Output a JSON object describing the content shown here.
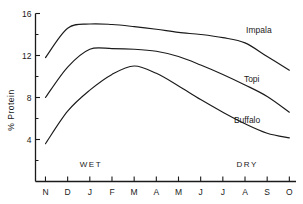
{
  "chart_data": {
    "type": "line",
    "title": "",
    "xlabel": "",
    "ylabel": "% Protein",
    "categories": [
      "N",
      "D",
      "J",
      "F",
      "M",
      "A",
      "M",
      "J",
      "J",
      "A",
      "S",
      "O"
    ],
    "xlim": [
      -0.45,
      11.3
    ],
    "ylim": [
      0,
      16
    ],
    "yticks_major": [
      4,
      8,
      12,
      16
    ],
    "yticks_minor": [
      2,
      6,
      10,
      14
    ],
    "grid": false,
    "legend_position": "inline-right",
    "series": [
      {
        "name": "Impala",
        "values": [
          11.8,
          14.6,
          15.0,
          14.95,
          14.75,
          14.5,
          14.2,
          14.0,
          13.7,
          13.2,
          11.9,
          10.6
        ],
        "label": "Impala",
        "label_x": 9.05,
        "label_y": 14.1
      },
      {
        "name": "Topi",
        "values": [
          8.0,
          10.9,
          12.6,
          12.65,
          12.6,
          12.4,
          11.9,
          11.1,
          10.2,
          9.2,
          8.1,
          6.6
        ],
        "label": "Topi",
        "label_x": 8.95,
        "label_y": 9.45
      },
      {
        "name": "Buffalo",
        "values": [
          3.6,
          6.7,
          8.7,
          10.2,
          11.0,
          10.3,
          9.1,
          7.8,
          6.6,
          5.5,
          4.6,
          4.15
        ],
        "label": "Buffalo",
        "label_x": 8.5,
        "label_y": 5.6
      }
    ],
    "annotations": [
      {
        "text": "WET",
        "x_category_index": 2.05,
        "y": 1.35
      },
      {
        "text": "DRY",
        "x_category_index": 9.1,
        "y": 1.35
      }
    ],
    "colors": {
      "axis": "#1a1a1a",
      "curve": "#1a1a1a",
      "background": "#ffffff"
    }
  }
}
